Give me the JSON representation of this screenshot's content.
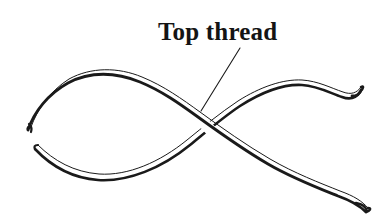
{
  "figure": {
    "kind": "line-drawing",
    "title": "Top thread",
    "background_color": "#ffffff",
    "ink_color": "#1a1a1a",
    "width": 386,
    "height": 218,
    "label": {
      "text": "Top thread",
      "x": 158,
      "y": 18,
      "font_weight": "bold",
      "font_style": "serif",
      "font_size_px": 25,
      "color": "#141414"
    },
    "leader_line": {
      "name": "leader-line",
      "from_x": 240,
      "from_y": 48,
      "to_x": 201,
      "to_y": 111,
      "stroke_width": 1
    },
    "threads": [
      {
        "id": "top-thread",
        "label": "Top thread",
        "description": "Thread running from upper-left over the arc and descending across to the lower-right; passes over the other thread at the crossing.",
        "is_on_top": true,
        "start_x": 28,
        "start_y": 130,
        "end_x": 368,
        "end_y": 212
      },
      {
        "id": "bottom-thread",
        "label": "Bottom thread",
        "description": "Thread running from lower-left dipping through a trough and ascending to the upper-right; passes under the top thread at the crossing.",
        "is_on_top": false,
        "start_x": 35,
        "start_y": 149,
        "end_x": 360,
        "end_y": 90
      }
    ],
    "crossing_point": {
      "name": "thread-crossing",
      "x": 203,
      "y": 114
    }
  }
}
